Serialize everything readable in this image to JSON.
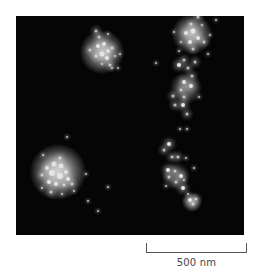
{
  "figure": {
    "type": "fluorescence super-resolution micrograph",
    "background_color": "#050505",
    "dot_color": "#e8e8e8"
  },
  "scale_bar": {
    "label": "500 nm"
  },
  "glows": [
    {
      "x": 86,
      "y": 36,
      "r": 22,
      "o": 0.85
    },
    {
      "x": 42,
      "y": 156,
      "r": 28,
      "o": 0.95
    },
    {
      "x": 176,
      "y": 18,
      "r": 20,
      "o": 0.8
    },
    {
      "x": 170,
      "y": 72,
      "r": 16,
      "o": 0.55
    },
    {
      "x": 160,
      "y": 160,
      "r": 14,
      "o": 0.4
    },
    {
      "x": 176,
      "y": 186,
      "r": 10,
      "o": 0.6
    }
  ],
  "dots": [
    {
      "x": 80,
      "y": 15,
      "s": 3
    },
    {
      "x": 83,
      "y": 21,
      "s": 3
    },
    {
      "x": 92,
      "y": 18,
      "s": 2
    },
    {
      "x": 74,
      "y": 34,
      "s": 3
    },
    {
      "x": 82,
      "y": 30,
      "s": 4
    },
    {
      "x": 88,
      "y": 28,
      "s": 4
    },
    {
      "x": 92,
      "y": 35,
      "s": 4
    },
    {
      "x": 86,
      "y": 38,
      "s": 5
    },
    {
      "x": 96,
      "y": 32,
      "s": 3
    },
    {
      "x": 80,
      "y": 40,
      "s": 3
    },
    {
      "x": 91,
      "y": 42,
      "s": 4
    },
    {
      "x": 99,
      "y": 40,
      "s": 2
    },
    {
      "x": 94,
      "y": 49,
      "s": 3
    },
    {
      "x": 86,
      "y": 48,
      "s": 2
    },
    {
      "x": 104,
      "y": 38,
      "s": 2
    },
    {
      "x": 96,
      "y": 52,
      "s": 2
    },
    {
      "x": 102,
      "y": 52,
      "s": 2
    },
    {
      "x": 26,
      "y": 159,
      "s": 3
    },
    {
      "x": 31,
      "y": 152,
      "s": 4
    },
    {
      "x": 38,
      "y": 148,
      "s": 5
    },
    {
      "x": 45,
      "y": 150,
      "s": 5
    },
    {
      "x": 50,
      "y": 156,
      "s": 4
    },
    {
      "x": 36,
      "y": 157,
      "s": 6
    },
    {
      "x": 44,
      "y": 160,
      "s": 6
    },
    {
      "x": 52,
      "y": 163,
      "s": 4
    },
    {
      "x": 33,
      "y": 166,
      "s": 4
    },
    {
      "x": 40,
      "y": 168,
      "s": 4
    },
    {
      "x": 48,
      "y": 169,
      "s": 3
    },
    {
      "x": 56,
      "y": 168,
      "s": 3
    },
    {
      "x": 44,
      "y": 142,
      "s": 3
    },
    {
      "x": 26,
      "y": 172,
      "s": 2
    },
    {
      "x": 35,
      "y": 176,
      "s": 3
    },
    {
      "x": 46,
      "y": 178,
      "s": 2
    },
    {
      "x": 58,
      "y": 175,
      "s": 2
    },
    {
      "x": 27,
      "y": 139,
      "s": 2
    },
    {
      "x": 51,
      "y": 121,
      "s": 2
    },
    {
      "x": 70,
      "y": 158,
      "s": 2
    },
    {
      "x": 92,
      "y": 171,
      "s": 2
    },
    {
      "x": 72,
      "y": 185,
      "s": 2
    },
    {
      "x": 82,
      "y": 195,
      "s": 2
    },
    {
      "x": 182,
      "y": 1,
      "s": 3
    },
    {
      "x": 175,
      "y": 8,
      "s": 3
    },
    {
      "x": 186,
      "y": 9,
      "s": 2
    },
    {
      "x": 158,
      "y": 16,
      "s": 2
    },
    {
      "x": 170,
      "y": 17,
      "s": 4
    },
    {
      "x": 177,
      "y": 15,
      "s": 5
    },
    {
      "x": 182,
      "y": 22,
      "s": 4
    },
    {
      "x": 174,
      "y": 26,
      "s": 4
    },
    {
      "x": 188,
      "y": 26,
      "s": 3
    },
    {
      "x": 165,
      "y": 26,
      "s": 2
    },
    {
      "x": 194,
      "y": 19,
      "s": 2
    },
    {
      "x": 200,
      "y": 4,
      "s": 2
    },
    {
      "x": 163,
      "y": 35,
      "s": 2
    },
    {
      "x": 177,
      "y": 33,
      "s": 3
    },
    {
      "x": 192,
      "y": 38,
      "s": 2
    },
    {
      "x": 168,
      "y": 44,
      "s": 3
    },
    {
      "x": 179,
      "y": 46,
      "s": 3
    },
    {
      "x": 163,
      "y": 49,
      "s": 4
    },
    {
      "x": 172,
      "y": 52,
      "s": 3
    },
    {
      "x": 140,
      "y": 47,
      "s": 2
    },
    {
      "x": 176,
      "y": 60,
      "s": 3
    },
    {
      "x": 168,
      "y": 66,
      "s": 4
    },
    {
      "x": 175,
      "y": 70,
      "s": 4
    },
    {
      "x": 165,
      "y": 74,
      "s": 3
    },
    {
      "x": 157,
      "y": 80,
      "s": 3
    },
    {
      "x": 168,
      "y": 81,
      "s": 3
    },
    {
      "x": 183,
      "y": 81,
      "s": 2
    },
    {
      "x": 159,
      "y": 89,
      "s": 3
    },
    {
      "x": 167,
      "y": 89,
      "s": 4
    },
    {
      "x": 171,
      "y": 98,
      "s": 3
    },
    {
      "x": 164,
      "y": 113,
      "s": 2
    },
    {
      "x": 171,
      "y": 113,
      "s": 2
    },
    {
      "x": 153,
      "y": 128,
      "s": 4
    },
    {
      "x": 148,
      "y": 134,
      "s": 3
    },
    {
      "x": 156,
      "y": 141,
      "s": 3
    },
    {
      "x": 162,
      "y": 141,
      "s": 3
    },
    {
      "x": 170,
      "y": 142,
      "s": 2
    },
    {
      "x": 152,
      "y": 154,
      "s": 4
    },
    {
      "x": 159,
      "y": 155,
      "s": 3
    },
    {
      "x": 165,
      "y": 160,
      "s": 4
    },
    {
      "x": 178,
      "y": 152,
      "s": 2
    },
    {
      "x": 153,
      "y": 161,
      "s": 3
    },
    {
      "x": 160,
      "y": 166,
      "s": 3
    },
    {
      "x": 168,
      "y": 164,
      "s": 2
    },
    {
      "x": 150,
      "y": 170,
      "s": 2
    },
    {
      "x": 167,
      "y": 172,
      "s": 4
    },
    {
      "x": 172,
      "y": 178,
      "s": 2
    },
    {
      "x": 174,
      "y": 184,
      "s": 4
    },
    {
      "x": 180,
      "y": 183,
      "s": 3
    },
    {
      "x": 177,
      "y": 188,
      "s": 3
    }
  ]
}
